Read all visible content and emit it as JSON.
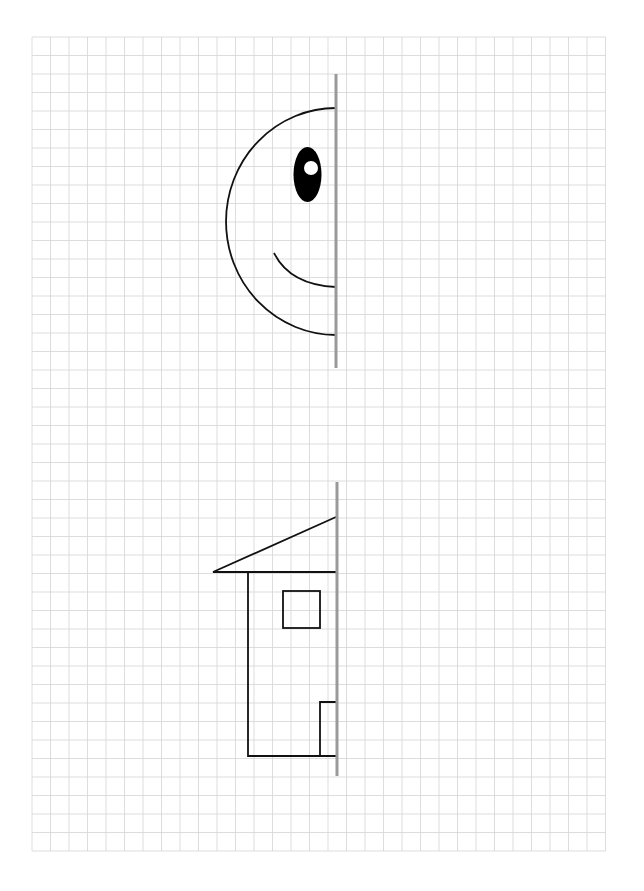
{
  "worksheet": {
    "title": "Symmetry worksheet: complete the picture",
    "background_color": "#ffffff",
    "grid": {
      "left": 32,
      "top": 37,
      "columns": 31,
      "rows": 44,
      "cell_width": 18.5,
      "cell_height": 18.5,
      "line_color": "#d4d4d4",
      "line_width": 0.8
    },
    "ink_color": "#111111",
    "mirror_line_color": "#9a9a9a",
    "mirror_line_width": 3,
    "figures": [
      {
        "name": "smiley-face-half",
        "mirror_line": {
          "x": 336,
          "y1": 74,
          "y2": 368
        },
        "face_outline": {
          "cx": 336,
          "cy": 221.5,
          "rx": 110,
          "ry": 113.5
        },
        "eye": {
          "cx": 307.5,
          "cy": 174.5,
          "rx": 14,
          "ry": 27.5
        },
        "eye_highlight": {
          "cx": 311,
          "cy": 168,
          "r": 7,
          "color": "#ffffff"
        },
        "mouth": {
          "x1": 274,
          "y1": 253,
          "cx": 290,
          "cy": 285,
          "x2": 336,
          "y2": 287
        }
      },
      {
        "name": "house-half",
        "mirror_line": {
          "x": 337,
          "y1": 482,
          "y2": 776
        },
        "roof": {
          "apex_x": 336,
          "apex_y": 517,
          "left_x": 213,
          "eave_y": 572
        },
        "wall": {
          "left_x": 248,
          "top_y": 572,
          "bottom_y": 756,
          "right_x": 336
        },
        "window": {
          "x": 283,
          "y": 591,
          "width": 37,
          "height": 37
        },
        "door": {
          "x": 320,
          "top_y": 702,
          "bottom_y": 756,
          "right_x": 336
        }
      }
    ]
  }
}
